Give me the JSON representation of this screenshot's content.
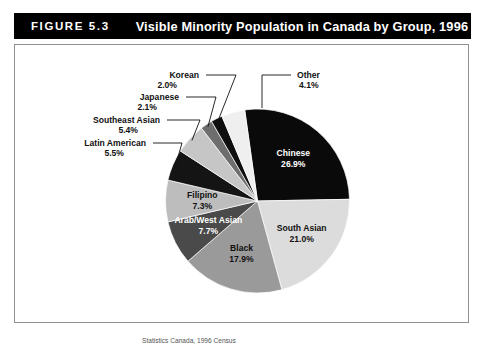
{
  "figure": {
    "number_label": "FIGURE 5.3",
    "title": "Visible Minority Population in Canada by Group, 1996",
    "source_note": "Statistics Canada, 1996 Census"
  },
  "colors": {
    "title_bar_bg": "#000000",
    "title_bar_text": "#ffffff",
    "frame_border": "#8f8f8f",
    "page_bg": "#ffffff",
    "label_dark": "#111111",
    "label_light": "#ffffff"
  },
  "chart_data": {
    "type": "pie",
    "title": "Visible Minority Population in Canada by Group, 1996",
    "unit": "%",
    "legend": "none",
    "labels_position": "inside-and-callout",
    "total": 100.0,
    "start_angle_deg": -8,
    "direction": "clockwise",
    "categories": [
      "Chinese",
      "South Asian",
      "Black",
      "Arab/West Asian",
      "Filipino",
      "Latin American",
      "Southeast Asian",
      "Japanese",
      "Korean",
      "Other"
    ],
    "values": [
      26.9,
      21.0,
      17.9,
      7.7,
      7.3,
      5.5,
      5.4,
      2.1,
      2.0,
      4.1
    ],
    "slices": [
      {
        "name": "Chinese",
        "value": 26.9,
        "display": "26.9%",
        "color": "#0a0a0a",
        "text_color": "#ffffff",
        "label_mode": "inside"
      },
      {
        "name": "South Asian",
        "value": 21.0,
        "display": "21.0%",
        "color": "#dcdcdc",
        "text_color": "#111111",
        "label_mode": "inside"
      },
      {
        "name": "Black",
        "value": 17.9,
        "display": "17.9%",
        "color": "#9a9a9a",
        "text_color": "#111111",
        "label_mode": "inside"
      },
      {
        "name": "Arab/West Asian",
        "value": 7.7,
        "display": "7.7%",
        "color": "#4a4a4a",
        "text_color": "#ffffff",
        "label_mode": "inside"
      },
      {
        "name": "Filipino",
        "value": 7.3,
        "display": "7.3%",
        "color": "#bdbdbd",
        "text_color": "#111111",
        "label_mode": "inside"
      },
      {
        "name": "Latin American",
        "value": 5.5,
        "display": "5.5%",
        "color": "#141414",
        "text_color": "#111111",
        "label_mode": "callout"
      },
      {
        "name": "Southeast Asian",
        "value": 5.4,
        "display": "5.4%",
        "color": "#c6c6c6",
        "text_color": "#111111",
        "label_mode": "callout"
      },
      {
        "name": "Japanese",
        "value": 2.1,
        "display": "2.1%",
        "color": "#6e6e6e",
        "text_color": "#111111",
        "label_mode": "callout"
      },
      {
        "name": "Korean",
        "value": 2.0,
        "display": "2.0%",
        "color": "#0f0f0f",
        "text_color": "#111111",
        "label_mode": "callout"
      },
      {
        "name": "Other",
        "value": 4.1,
        "display": "4.1%",
        "color": "#efefef",
        "text_color": "#111111",
        "label_mode": "callout"
      }
    ]
  }
}
